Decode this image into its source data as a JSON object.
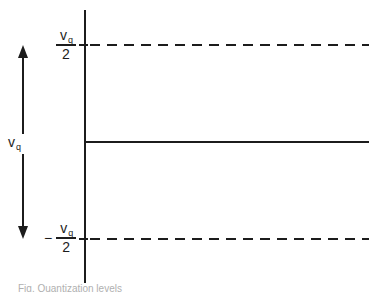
{
  "diagram": {
    "type": "quantization-levels-figure",
    "colors": {
      "ink": "#1c1c1c",
      "background": "#ffffff",
      "caption_ink": "#b0b0b0"
    },
    "upper_level_label": {
      "base": "v",
      "sub": "q",
      "denominator": "2"
    },
    "lower_level_label": {
      "sign": "−",
      "base": "v",
      "sub": "q",
      "denominator": "2"
    },
    "range_label": {
      "base": "v",
      "sub": "q"
    },
    "caption_fragment": "Fig.    Quantization levels"
  }
}
